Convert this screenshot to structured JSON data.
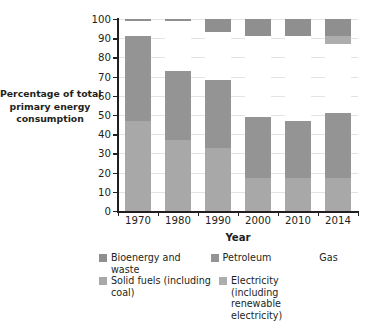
{
  "chart_data": {
    "type": "bar",
    "subtype": "stacked-bar",
    "title": "",
    "xlabel": "Year",
    "ylabel": "Percentage of total primary energy consumption",
    "categories": [
      "1970",
      "1980",
      "1990",
      "2000",
      "2010",
      "2014"
    ],
    "ylim": [
      0,
      100
    ],
    "ytick_labels": [
      "0",
      "10",
      "20",
      "30",
      "40",
      "50",
      "60",
      "70",
      "80",
      "90",
      "100"
    ],
    "ytick_values": [
      0,
      10,
      20,
      30,
      40,
      50,
      60,
      70,
      80,
      90,
      100
    ],
    "grid": true,
    "grid_axis": "y",
    "legend_position": "bottom",
    "series": [
      {
        "name": "Solid fuels (including coal)",
        "color": "#a8a8a8",
        "values": [
          47,
          37,
          33,
          17,
          17,
          17
        ]
      },
      {
        "name": "Petroleum",
        "color": "#949494",
        "values": [
          44,
          36,
          35,
          32,
          30,
          34
        ]
      },
      {
        "name": "Gas",
        "color": "#ffffff",
        "values": [
          8,
          26,
          25,
          42,
          44,
          36
        ]
      },
      {
        "name": "Electricity (including renewable electricity)",
        "color": "#adadad",
        "values": [
          0,
          0,
          0,
          0,
          0,
          4
        ]
      },
      {
        "name": "Bioenergy and waste",
        "color": "#8f8f8f",
        "values": [
          1,
          1,
          7,
          9,
          9,
          9
        ]
      }
    ],
    "stack_tops": {
      "1970": {
        "solid_fuels": 47,
        "petroleum": 91,
        "gas": 99,
        "electricity": 99,
        "bioenergy": 100
      },
      "1980": {
        "solid_fuels": 37,
        "petroleum": 73,
        "gas": 99,
        "electricity": 99,
        "bioenergy": 100
      },
      "1990": {
        "solid_fuels": 33,
        "petroleum": 68,
        "gas": 93,
        "electricity": 93,
        "bioenergy": 100
      },
      "2000": {
        "solid_fuels": 17,
        "petroleum": 49,
        "gas": 91,
        "electricity": 91,
        "bioenergy": 100
      },
      "2010": {
        "solid_fuels": 17,
        "petroleum": 47,
        "gas": 91,
        "electricity": 91,
        "bioenergy": 100
      },
      "2014": {
        "solid_fuels": 17,
        "petroleum": 51,
        "gas": 87,
        "electricity": 91,
        "bioenergy": 100
      }
    }
  },
  "axes": {
    "y_title_line1": "Percentage of total",
    "y_title_line2": "primary energy",
    "y_title_line3": "consumption",
    "x_title": "Year"
  },
  "legend": {
    "items": [
      {
        "label": "Bioenergy and waste",
        "color": "#8f8f8f",
        "has_swatch": true
      },
      {
        "label": "Petroleum",
        "color": "#949494",
        "has_swatch": true
      },
      {
        "label": "Gas",
        "color": "#ffffff",
        "has_swatch": false
      },
      {
        "label": "Solid fuels (including coal)",
        "label_line1": "Solid fuels (including",
        "label_line2": "coal)",
        "color": "#a8a8a8",
        "has_swatch": true
      },
      {
        "label": "Electricity (including renewable electricity)",
        "label_line1": "Electricity (including",
        "label_line2": "renewable electricity)",
        "color": "#adadad",
        "has_swatch": true
      }
    ]
  },
  "colors": {
    "axis": "#231f20",
    "grid": "#e3e3e3",
    "background": "#ffffff",
    "bar_solid_fuels": "#a8a8a8",
    "bar_petroleum": "#949494",
    "bar_gas": "#ffffff",
    "bar_electricity": "#adadad",
    "bar_bioenergy": "#8f8f8f"
  }
}
